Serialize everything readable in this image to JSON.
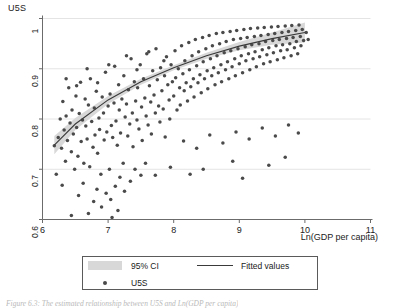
{
  "figure": {
    "caption": "Figure 6.3:  The estimated relationship between U5S and Ln(GDP per capita)"
  },
  "axes": {
    "y_title": "U5S",
    "x_title": "Ln(GDP per capita)",
    "y_ticks": [
      "0.6",
      "0.7",
      "0.8",
      "0.9",
      "1"
    ],
    "x_ticks": [
      "6",
      "7",
      "8",
      "9",
      "10",
      "11"
    ]
  },
  "legend": {
    "ci_label": "95% CI",
    "fitted_label": "Fitted values",
    "points_label": "U5S"
  },
  "colors": {
    "point": "#4a4a4a",
    "fit_line": "#3a3a3a",
    "ci_band": "#d8d8d8",
    "grid": "#e4e4e4",
    "axis": "#6b6b6b",
    "background": "#ffffff"
  },
  "chart_data": {
    "type": "scatter",
    "title": "",
    "xlabel": "Ln(GDP per capita)",
    "ylabel": "U5S",
    "xlim": [
      6,
      11
    ],
    "ylim": [
      0.6,
      1.0
    ],
    "xticks": [
      6,
      7,
      8,
      9,
      10,
      11
    ],
    "yticks": [
      0.6,
      0.7,
      0.8,
      0.9,
      1.0
    ],
    "grid": "horizontal",
    "legend_position": "below-plot",
    "series": [
      {
        "name": "U5S",
        "type": "scatter",
        "marker": "filled-circle",
        "color": "#4a4a4a",
        "points": [
          [
            6.18,
            0.747
          ],
          [
            6.21,
            0.69
          ],
          [
            6.24,
            0.763
          ],
          [
            6.27,
            0.8
          ],
          [
            6.29,
            0.742
          ],
          [
            6.31,
            0.835
          ],
          [
            6.33,
            0.778
          ],
          [
            6.35,
            0.716
          ],
          [
            6.36,
            0.806
          ],
          [
            6.38,
            0.757
          ],
          [
            6.4,
            0.862
          ],
          [
            6.42,
            0.792
          ],
          [
            6.44,
            0.735
          ],
          [
            6.45,
            0.818
          ],
          [
            6.47,
            0.77
          ],
          [
            6.49,
            0.7
          ],
          [
            6.51,
            0.846
          ],
          [
            6.52,
            0.783
          ],
          [
            6.54,
            0.726
          ],
          [
            6.56,
            0.811
          ],
          [
            6.58,
            0.873
          ],
          [
            6.59,
            0.755
          ],
          [
            6.61,
            0.798
          ],
          [
            6.63,
            0.712
          ],
          [
            6.65,
            0.84
          ],
          [
            6.66,
            0.786
          ],
          [
            6.68,
            0.76
          ],
          [
            6.7,
            0.828
          ],
          [
            6.72,
            0.705
          ],
          [
            6.73,
            0.88
          ],
          [
            6.75,
            0.795
          ],
          [
            6.77,
            0.744
          ],
          [
            6.79,
            0.822
          ],
          [
            6.8,
            0.768
          ],
          [
            6.82,
            0.855
          ],
          [
            6.84,
            0.732
          ],
          [
            6.86,
            0.802
          ],
          [
            6.87,
            0.779
          ],
          [
            6.89,
            0.69
          ],
          [
            6.91,
            0.844
          ],
          [
            6.93,
            0.812
          ],
          [
            6.94,
            0.758
          ],
          [
            6.96,
            0.893
          ],
          [
            6.98,
            0.774
          ],
          [
            7.0,
            0.826
          ],
          [
            7.02,
            0.7
          ],
          [
            7.03,
            0.85
          ],
          [
            7.05,
            0.787
          ],
          [
            7.07,
            0.763
          ],
          [
            7.09,
            0.832
          ],
          [
            7.1,
            0.905
          ],
          [
            7.12,
            0.796
          ],
          [
            7.14,
            0.748
          ],
          [
            7.16,
            0.868
          ],
          [
            7.17,
            0.818
          ],
          [
            7.19,
            0.772
          ],
          [
            7.21,
            0.84
          ],
          [
            7.23,
            0.712
          ],
          [
            7.24,
            0.886
          ],
          [
            7.26,
            0.804
          ],
          [
            7.28,
            0.83
          ],
          [
            7.3,
            0.766
          ],
          [
            7.31,
            0.858
          ],
          [
            7.33,
            0.79
          ],
          [
            7.35,
            0.92
          ],
          [
            7.37,
            0.812
          ],
          [
            7.38,
            0.745
          ],
          [
            7.4,
            0.874
          ],
          [
            7.42,
            0.836
          ],
          [
            7.44,
            0.798
          ],
          [
            7.45,
            0.862
          ],
          [
            7.47,
            0.78
          ],
          [
            7.49,
            0.908
          ],
          [
            7.51,
            0.824
          ],
          [
            7.52,
            0.757
          ],
          [
            7.54,
            0.88
          ],
          [
            7.56,
            0.842
          ],
          [
            7.58,
            0.806
          ],
          [
            7.59,
            0.93
          ],
          [
            7.61,
            0.788
          ],
          [
            7.63,
            0.866
          ],
          [
            7.65,
            0.834
          ],
          [
            7.66,
            0.77
          ],
          [
            7.68,
            0.896
          ],
          [
            7.7,
            0.848
          ],
          [
            7.72,
            0.812
          ],
          [
            7.73,
            0.94
          ],
          [
            7.75,
            0.878
          ],
          [
            7.77,
            0.826
          ],
          [
            7.79,
            0.794
          ],
          [
            7.8,
            0.902
          ],
          [
            7.82,
            0.856
          ],
          [
            7.84,
            0.82
          ],
          [
            7.86,
            0.886
          ],
          [
            7.87,
            0.764
          ],
          [
            7.89,
            0.924
          ],
          [
            7.91,
            0.868
          ],
          [
            7.93,
            0.838
          ],
          [
            7.94,
            0.8
          ],
          [
            7.96,
            0.908
          ],
          [
            7.98,
            0.874
          ],
          [
            8.0,
            0.846
          ],
          [
            8.02,
            0.936
          ],
          [
            8.03,
            0.882
          ],
          [
            8.05,
            0.818
          ],
          [
            8.07,
            0.9
          ],
          [
            8.09,
            0.862
          ],
          [
            8.1,
            0.828
          ],
          [
            8.12,
            0.946
          ],
          [
            8.14,
            0.89
          ],
          [
            8.16,
            0.856
          ],
          [
            8.17,
            0.916
          ],
          [
            8.19,
            0.872
          ],
          [
            8.21,
            0.836
          ],
          [
            8.23,
            0.952
          ],
          [
            8.24,
            0.898
          ],
          [
            8.26,
            0.864
          ],
          [
            8.28,
            0.926
          ],
          [
            8.3,
            0.88
          ],
          [
            8.31,
            0.844
          ],
          [
            8.33,
            0.958
          ],
          [
            8.35,
            0.906
          ],
          [
            8.37,
            0.872
          ],
          [
            8.38,
            0.934
          ],
          [
            8.4,
            0.888
          ],
          [
            8.42,
            0.852
          ],
          [
            8.44,
            0.962
          ],
          [
            8.45,
            0.914
          ],
          [
            8.47,
            0.88
          ],
          [
            8.49,
            0.94
          ],
          [
            8.51,
            0.896
          ],
          [
            8.52,
            0.86
          ],
          [
            8.54,
            0.966
          ],
          [
            8.56,
            0.92
          ],
          [
            8.58,
            0.886
          ],
          [
            8.59,
            0.946
          ],
          [
            8.61,
            0.902
          ],
          [
            8.63,
            0.868
          ],
          [
            8.65,
            0.97
          ],
          [
            8.66,
            0.926
          ],
          [
            8.68,
            0.892
          ],
          [
            8.7,
            0.95
          ],
          [
            8.72,
            0.908
          ],
          [
            8.73,
            0.874
          ],
          [
            8.75,
            0.972
          ],
          [
            8.77,
            0.932
          ],
          [
            8.79,
            0.898
          ],
          [
            8.8,
            0.954
          ],
          [
            8.82,
            0.914
          ],
          [
            8.84,
            0.88
          ],
          [
            8.86,
            0.974
          ],
          [
            8.87,
            0.936
          ],
          [
            8.89,
            0.904
          ],
          [
            8.91,
            0.958
          ],
          [
            8.93,
            0.92
          ],
          [
            8.94,
            0.886
          ],
          [
            8.96,
            0.976
          ],
          [
            8.98,
            0.94
          ],
          [
            9.0,
            0.91
          ],
          [
            9.02,
            0.96
          ],
          [
            9.03,
            0.926
          ],
          [
            9.05,
            0.892
          ],
          [
            9.07,
            0.978
          ],
          [
            9.09,
            0.944
          ],
          [
            9.1,
            0.916
          ],
          [
            9.12,
            0.962
          ],
          [
            9.14,
            0.93
          ],
          [
            9.16,
            0.898
          ],
          [
            9.17,
            0.98
          ],
          [
            9.19,
            0.948
          ],
          [
            9.21,
            0.92
          ],
          [
            9.23,
            0.964
          ],
          [
            9.24,
            0.934
          ],
          [
            9.26,
            0.904
          ],
          [
            9.28,
            0.981
          ],
          [
            9.3,
            0.95
          ],
          [
            9.31,
            0.924
          ],
          [
            9.33,
            0.966
          ],
          [
            9.35,
            0.938
          ],
          [
            9.37,
            0.91
          ],
          [
            9.38,
            0.982
          ],
          [
            9.4,
            0.954
          ],
          [
            9.42,
            0.928
          ],
          [
            9.44,
            0.968
          ],
          [
            9.45,
            0.942
          ],
          [
            9.47,
            0.914
          ],
          [
            9.49,
            0.983
          ],
          [
            9.51,
            0.956
          ],
          [
            9.52,
            0.932
          ],
          [
            9.54,
            0.97
          ],
          [
            9.56,
            0.946
          ],
          [
            9.58,
            0.918
          ],
          [
            9.59,
            0.984
          ],
          [
            9.61,
            0.958
          ],
          [
            9.63,
            0.936
          ],
          [
            9.65,
            0.972
          ],
          [
            9.66,
            0.948
          ],
          [
            9.68,
            0.922
          ],
          [
            9.7,
            0.985
          ],
          [
            9.72,
            0.96
          ],
          [
            9.73,
            0.938
          ],
          [
            9.75,
            0.974
          ],
          [
            9.77,
            0.95
          ],
          [
            9.79,
            0.926
          ],
          [
            9.8,
            0.986
          ],
          [
            9.82,
            0.962
          ],
          [
            9.84,
            0.942
          ],
          [
            9.86,
            0.976
          ],
          [
            9.87,
            0.954
          ],
          [
            9.89,
            0.93
          ],
          [
            9.91,
            0.987
          ],
          [
            9.93,
            0.964
          ],
          [
            9.94,
            0.946
          ],
          [
            9.96,
            0.978
          ],
          [
            9.98,
            0.956
          ],
          [
            6.3,
            0.668
          ],
          [
            6.55,
            0.648
          ],
          [
            6.62,
            0.672
          ],
          [
            6.78,
            0.636
          ],
          [
            6.83,
            0.66
          ],
          [
            6.9,
            0.625
          ],
          [
            6.97,
            0.652
          ],
          [
            7.04,
            0.64
          ],
          [
            7.11,
            0.666
          ],
          [
            7.18,
            0.684
          ],
          [
            7.25,
            0.656
          ],
          [
            7.34,
            0.676
          ],
          [
            7.41,
            0.7
          ],
          [
            7.5,
            0.688
          ],
          [
            7.57,
            0.712
          ],
          [
            6.44,
            0.608
          ],
          [
            6.7,
            0.612
          ],
          [
            7.06,
            0.604
          ],
          [
            7.15,
            0.618
          ],
          [
            8.15,
            0.756
          ],
          [
            8.35,
            0.742
          ],
          [
            8.55,
            0.768
          ],
          [
            8.75,
            0.752
          ],
          [
            8.95,
            0.774
          ],
          [
            9.15,
            0.76
          ],
          [
            9.35,
            0.782
          ],
          [
            9.55,
            0.766
          ],
          [
            9.75,
            0.788
          ],
          [
            9.9,
            0.772
          ],
          [
            8.45,
            0.7
          ],
          [
            8.9,
            0.716
          ],
          [
            9.45,
            0.708
          ],
          [
            9.7,
            0.724
          ],
          [
            8.25,
            0.69
          ],
          [
            9.05,
            0.682
          ],
          [
            7.72,
            0.688
          ],
          [
            7.95,
            0.704
          ],
          [
            6.36,
            0.88
          ],
          [
            6.52,
            0.866
          ],
          [
            6.68,
            0.9
          ],
          [
            6.84,
            0.872
          ],
          [
            7.01,
            0.908
          ],
          [
            7.28,
            0.926
          ],
          [
            7.44,
            0.898
          ],
          [
            7.62,
            0.934
          ],
          [
            7.85,
            0.916
          ],
          [
            10.02,
            0.972
          ],
          [
            10.05,
            0.958
          ]
        ]
      },
      {
        "name": "Fitted values",
        "type": "line",
        "color": "#3a3a3a",
        "x": [
          6.18,
          6.5,
          7.0,
          7.5,
          8.0,
          8.5,
          9.0,
          9.5,
          10.0
        ],
        "y": [
          0.748,
          0.79,
          0.838,
          0.874,
          0.902,
          0.926,
          0.945,
          0.96,
          0.972
        ]
      },
      {
        "name": "95% CI",
        "type": "band",
        "color": "#d8d8d8",
        "x": [
          6.18,
          6.5,
          7.0,
          7.5,
          8.0,
          8.5,
          9.0,
          9.5,
          10.0
        ],
        "lower": [
          0.73,
          0.778,
          0.83,
          0.868,
          0.897,
          0.92,
          0.937,
          0.948,
          0.952
        ],
        "upper": [
          0.766,
          0.802,
          0.846,
          0.88,
          0.907,
          0.932,
          0.953,
          0.972,
          0.992
        ]
      }
    ]
  }
}
